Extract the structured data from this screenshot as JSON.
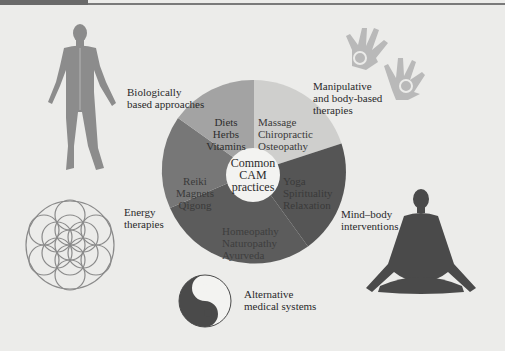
{
  "diagram": {
    "title_bar": {
      "accent_color": "#6a6a6a"
    },
    "center": {
      "label": "Common\nCAM\npractices"
    },
    "segments": [
      {
        "category": "Manipulative and body-based therapies",
        "items": "Massage\nChiropractic\nOsteopathy",
        "color": "#cfcfcd",
        "text_color": "#3a3a3a"
      },
      {
        "category": "Mind–body interventions",
        "items": "Yoga\nSpirituality\nRelaxation",
        "color": "#555555",
        "text_color": "#3a3a3a"
      },
      {
        "category": "Alternative medical systems",
        "items": "Homeopathy\nNaturopathy\nAyurveda",
        "color": "#5c5c5c",
        "text_color": "#3e3e3e"
      },
      {
        "category": "Energy therapies",
        "items": "Reiki\nMagnets\nQigong",
        "color": "#777777",
        "text_color": "#3a3a3a"
      },
      {
        "category": "Biologically based approaches",
        "items": "Diets\nHerbs\nVitamins",
        "color": "#a3a3a3",
        "text_color": "#2e2e2e"
      }
    ],
    "outer_labels": {
      "biological": "Biologically\nbased approaches",
      "manipulative": "Manipulative\nand body-based\ntherapies",
      "mind_body": "Mind–body\ninterventions",
      "energy": "Energy\ntherapies",
      "alternative": "Alternative\nmedical systems"
    },
    "icons": {
      "biological": "human-anatomy-icon",
      "manipulative": "hands-spiral-icon",
      "mind_body": "meditation-figure-icon",
      "energy": "flower-of-life-icon",
      "alternative": "yin-yang-icon"
    }
  }
}
